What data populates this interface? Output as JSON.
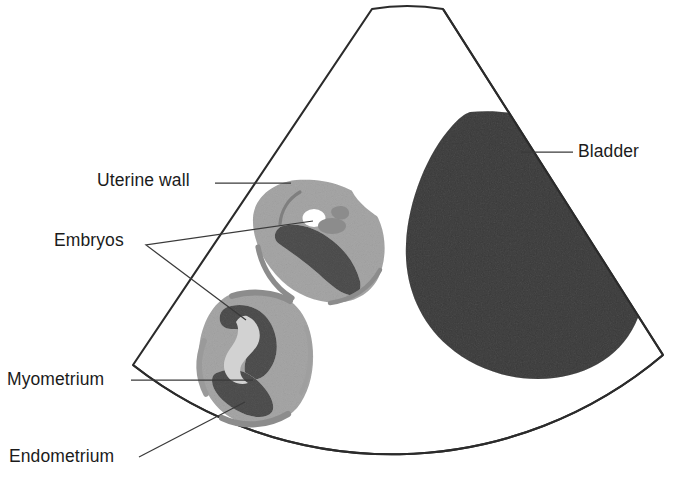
{
  "figure": {
    "kind": "medical-illustration",
    "background_color": "#ffffff",
    "outline_color": "#2b2b2b",
    "leader_line_color": "#3a3a3a"
  },
  "labels": {
    "uterine_wall": "Uterine wall",
    "embryos": "Embryos",
    "myometrium": "Myometrium",
    "endometrium": "Endometrium",
    "bladder": "Bladder"
  },
  "structures": [
    {
      "name": "scan-sector",
      "role": "ultrasound field of view outline",
      "fill": "#ffffff",
      "stroke": "#2b2b2b"
    },
    {
      "name": "bladder",
      "role": "anechoic fluid-filled bladder, speckled gray",
      "fill": "#7e7e7e",
      "label": "Bladder"
    },
    {
      "name": "upper-uterus",
      "role": "upper gestational sac with embryo",
      "myometrium_fill": "#cdcdcd",
      "endometrium_fill": "#8c8c8c",
      "embryo_fill": "#ffffff"
    },
    {
      "name": "lower-uterus",
      "role": "lower gestational sac with embryo",
      "myometrium_fill": "#cdcdcd",
      "endometrium_fill": "#8c8c8c",
      "embryo_fill": "#d2d2d2"
    }
  ],
  "colors": {
    "light_gray": "#cdcdcd",
    "mid_gray": "#8c8c8c",
    "bladder_gray": "#7e7e7e",
    "white": "#ffffff",
    "ink": "#1b1b1b"
  }
}
